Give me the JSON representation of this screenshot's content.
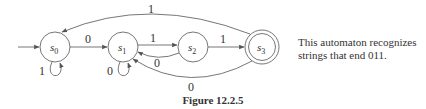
{
  "diagram": {
    "type": "finite-state-automaton",
    "states": [
      {
        "id": "s0",
        "label": "s",
        "sub": "0",
        "initial": true,
        "accepting": false
      },
      {
        "id": "s1",
        "label": "s",
        "sub": "1",
        "initial": false,
        "accepting": false
      },
      {
        "id": "s2",
        "label": "s",
        "sub": "2",
        "initial": false,
        "accepting": false
      },
      {
        "id": "s3",
        "label": "s",
        "sub": "3",
        "initial": false,
        "accepting": true
      }
    ],
    "transitions": [
      {
        "from": "s0",
        "to": "s1",
        "label": "0"
      },
      {
        "from": "s0",
        "to": "s0",
        "label": "1"
      },
      {
        "from": "s1",
        "to": "s1",
        "label": "0"
      },
      {
        "from": "s1",
        "to": "s2",
        "label": "1"
      },
      {
        "from": "s2",
        "to": "s1",
        "label": "0"
      },
      {
        "from": "s2",
        "to": "s3",
        "label": "1"
      },
      {
        "from": "s3",
        "to": "s0",
        "label": "1"
      },
      {
        "from": "s3",
        "to": "s1",
        "label": "0"
      }
    ]
  },
  "description": "This automaton recognizes strings that end 011.",
  "description_lines": [
    "This automaton recognizes",
    "strings that end 011."
  ],
  "caption": "Figure 12.2.5"
}
